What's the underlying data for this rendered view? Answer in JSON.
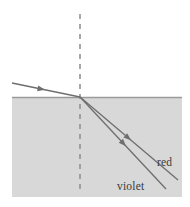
{
  "figure": {
    "title": "",
    "type": "optics-refraction-dispersion-diagram",
    "width": 190,
    "height": 207
  },
  "colors": {
    "background": "#ffffff",
    "medium_fill": "#d8d8d8",
    "interface_line": "#9a9a9a",
    "ray_stroke": "#6e6e6e",
    "normal_dash": "#8c8c8c",
    "label_text": "#3a3a3a"
  },
  "labels": {
    "red": "red",
    "violet": "violet"
  },
  "geometry": {
    "medium": {
      "x": 12,
      "y": 97,
      "width": 170,
      "height": 100
    },
    "interface": {
      "x1": 12,
      "y1": 97,
      "x2": 182,
      "y2": 97
    },
    "normal": {
      "x": 80,
      "y_top": 14,
      "y_bottom": 190,
      "dash": "5,5"
    },
    "incident_ray": {
      "x1": 12,
      "y1": 83,
      "x2": 80,
      "y2": 97
    },
    "incident_arrow": {
      "x": 45,
      "y": 89.8,
      "angle": 11.6
    },
    "red_ray": {
      "x1": 80,
      "y1": 97,
      "x2": 178,
      "y2": 180
    },
    "red_arrow": {
      "x": 131,
      "y": 140.2,
      "angle": 40.3
    },
    "violet_ray": {
      "x1": 80,
      "y1": 97,
      "x2": 166,
      "y2": 189
    },
    "violet_arrow": {
      "x": 126,
      "y": 146.2,
      "angle": 46.9
    },
    "red_label_pos": {
      "x": 157,
      "y": 166
    },
    "violet_label_pos": {
      "x": 117,
      "y": 190
    }
  },
  "annotations": {
    "description": "A light ray travels from the upper-left through a boundary and refracts into a denser gray medium, splitting into two closely spaced rays labeled red and violet. A vertical dashed normal line passes through the point of incidence."
  }
}
